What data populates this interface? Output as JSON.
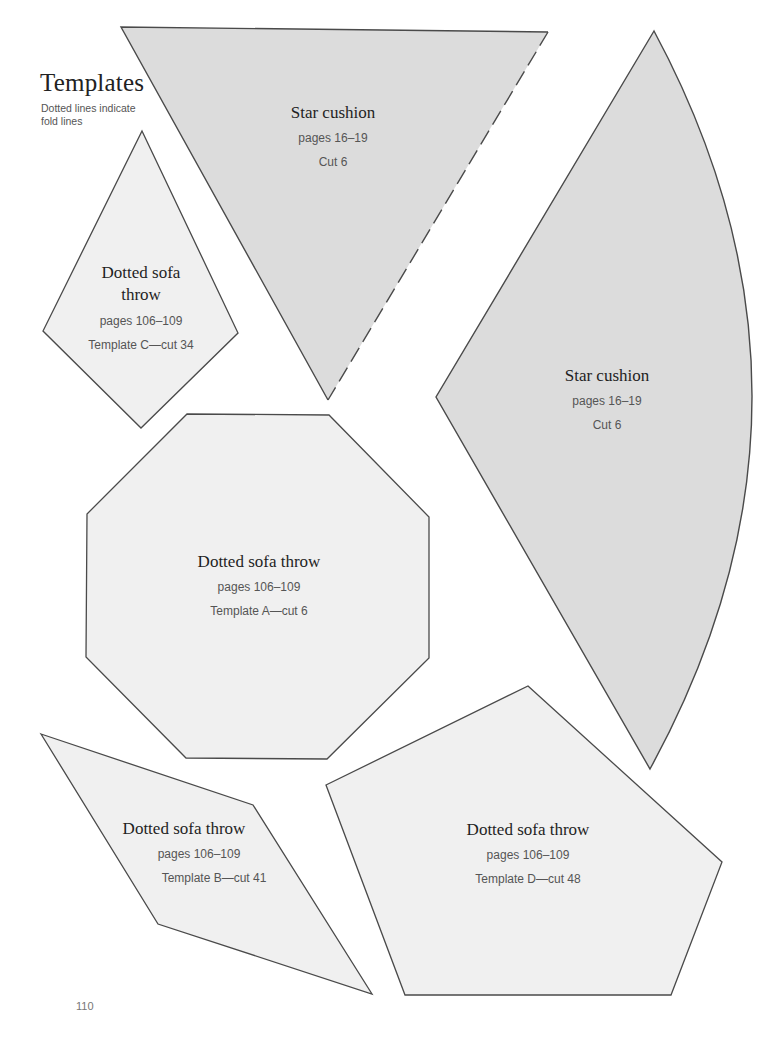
{
  "page": {
    "title": "Templates",
    "subtitle": "Dotted lines indicate fold lines",
    "page_number": "110"
  },
  "colors": {
    "star_fill": "#dcdcdc",
    "sofa_fill": "#f0f0f0",
    "outline": "#4a4a4a",
    "background": "#ffffff"
  },
  "templates": [
    {
      "id": "star-triangle",
      "shape": "triangle",
      "name": "Star cushion",
      "pages": "pages 16–19",
      "cut": "Cut 6",
      "fold_line": "right edge (dashed)"
    },
    {
      "id": "star-sector",
      "shape": "curved-wedge",
      "name": "Star cushion",
      "pages": "pages 16–19",
      "cut": "Cut 6"
    },
    {
      "id": "sofa-c",
      "shape": "kite",
      "name": "Dotted sofa throw",
      "pages": "pages 106–109",
      "cut": "Template C—cut 34"
    },
    {
      "id": "sofa-a",
      "shape": "octagon",
      "name": "Dotted sofa throw",
      "pages": "pages 106–109",
      "cut": "Template A—cut 6"
    },
    {
      "id": "sofa-b",
      "shape": "parallelogram",
      "name": "Dotted sofa throw",
      "pages": "pages 106–109",
      "cut": "Template B—cut 41"
    },
    {
      "id": "sofa-d",
      "shape": "pentagon",
      "name": "Dotted sofa throw",
      "pages": "pages 106–109",
      "cut": "Template D—cut 48"
    }
  ]
}
